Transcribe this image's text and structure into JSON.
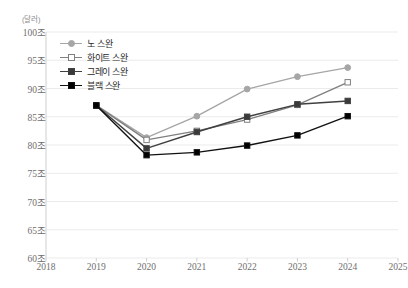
{
  "chart_data": {
    "type": "line",
    "title": "",
    "subtitle": "",
    "unit_label": "(달러)",
    "xlabel": "",
    "ylabel": "",
    "x": [
      2018,
      2019,
      2020,
      2021,
      2022,
      2023,
      2024,
      2025
    ],
    "xtick_labels": [
      "2018",
      "2019",
      "2020",
      "2021",
      "2022",
      "2023",
      "2024",
      "2025"
    ],
    "xlim": [
      2018,
      2025
    ],
    "ylim": [
      60,
      100
    ],
    "ytick_values": [
      60,
      65,
      70,
      75,
      80,
      85,
      90,
      95,
      100
    ],
    "ytick_labels": [
      "60조",
      "65조",
      "70조",
      "75조",
      "80조",
      "85조",
      "90조",
      "95조",
      "100조"
    ],
    "grid": true,
    "legend_position": "upper-left",
    "categories": [
      "2019",
      "2020",
      "2021",
      "2022",
      "2023",
      "2024"
    ],
    "series": [
      {
        "name": "노 스완",
        "color": "#a6a6a6",
        "marker": "circle",
        "marker_fill": "#a6a6a6",
        "x": [
          2019,
          2020,
          2021,
          2022,
          2023,
          2024
        ],
        "values": [
          87,
          81.3,
          85.1,
          89.9,
          92.1,
          93.7
        ]
      },
      {
        "name": "화이트 스완",
        "color": "#808080",
        "marker": "square-open",
        "marker_fill": "#ffffff",
        "x": [
          2019,
          2020,
          2021,
          2022,
          2023,
          2024
        ],
        "values": [
          87,
          80.9,
          82.5,
          84.5,
          87.1,
          91.1
        ]
      },
      {
        "name": "그레이 스완",
        "color": "#404040",
        "marker": "square",
        "marker_fill": "#3a3a3a",
        "x": [
          2019,
          2020,
          2021,
          2022,
          2023,
          2024
        ],
        "values": [
          87,
          79.4,
          82.3,
          85.0,
          87.2,
          87.8
        ]
      },
      {
        "name": "블랙 스완",
        "color": "#111111",
        "marker": "square",
        "marker_fill": "#000000",
        "x": [
          2019,
          2020,
          2021,
          2022,
          2023,
          2024
        ],
        "values": [
          87,
          78.2,
          78.7,
          79.9,
          81.7,
          85.1
        ]
      }
    ]
  },
  "legend": {
    "items": [
      {
        "label": "노 스완"
      },
      {
        "label": "화이트 스완"
      },
      {
        "label": "그레이 스완"
      },
      {
        "label": "블랙 스완"
      }
    ]
  }
}
